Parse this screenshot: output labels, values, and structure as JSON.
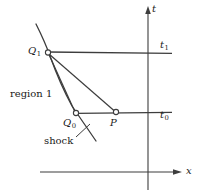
{
  "figure": {
    "background_color": "#ffffff",
    "line_color": "#3d3d3d",
    "text_color": "#1a1a1a"
  },
  "axes": {
    "vertical": {
      "label": "t",
      "name": "t-axis",
      "x": 148,
      "y_top": 8,
      "y_bottom": 190,
      "arrow": "up"
    },
    "horizontal": {
      "label": "x",
      "name": "x-axis",
      "y": 172,
      "x_left": 40,
      "x_right": 181,
      "arrow": "right"
    }
  },
  "time_lines": [
    {
      "label": "t",
      "subscript": "1",
      "name": "time-level-t1",
      "y": 52,
      "x_start": 48,
      "x_end": 172
    },
    {
      "label": "t",
      "subscript": "0",
      "name": "time-level-t0",
      "y": 113,
      "x_start": 76,
      "x_end": 172
    }
  ],
  "points": [
    {
      "id": "Q1",
      "label": "Q",
      "subscript": "1",
      "name": "point-q1",
      "x": 48,
      "y": 52
    },
    {
      "id": "Q0",
      "label": "Q",
      "subscript": "0",
      "name": "point-q0",
      "x": 76,
      "y": 113
    },
    {
      "id": "P",
      "label": "P",
      "subscript": "",
      "name": "point-p",
      "x": 116,
      "y": 112
    }
  ],
  "curves": [
    {
      "id": "shock",
      "label": "shock",
      "name": "shock-curve",
      "description": "curved shock path passing through Q1 and Q0"
    }
  ],
  "characteristics": [
    {
      "id": "q1-to-q0",
      "name": "characteristic-q1-q0",
      "from": "Q1",
      "to": "Q0"
    },
    {
      "id": "q1-to-p",
      "name": "characteristic-q1-p",
      "from": "Q1",
      "to": "P"
    }
  ],
  "annotations": [
    {
      "id": "region1",
      "text": "region 1",
      "name": "region-1-label",
      "x": 10,
      "y": 89
    },
    {
      "id": "shock-label",
      "text": "shock",
      "name": "shock-label",
      "x": 44,
      "y": 136
    }
  ]
}
